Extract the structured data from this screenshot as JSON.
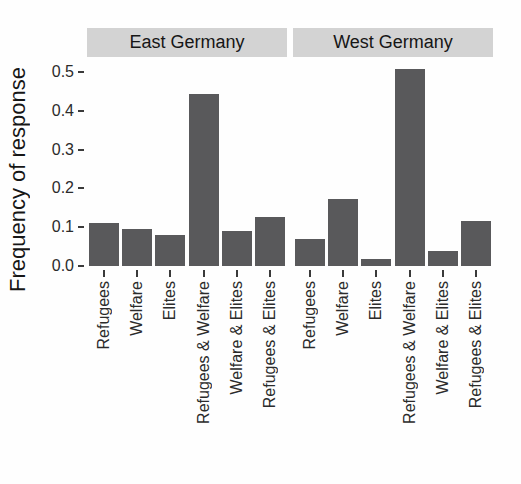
{
  "chart_data": {
    "type": "bar",
    "title": "",
    "xlabel": "",
    "ylabel": "Frequency of response",
    "categories": [
      "Refugees",
      "Welfare",
      "Elites",
      "Refugees & Welfare",
      "Welfare & Elites",
      "Refugees & Elites"
    ],
    "facets": [
      {
        "label": "East Germany",
        "values": [
          0.112,
          0.095,
          0.08,
          0.443,
          0.089,
          0.126
        ]
      },
      {
        "label": "West Germany",
        "values": [
          0.069,
          0.172,
          0.017,
          0.507,
          0.039,
          0.116
        ]
      }
    ],
    "y_ticks": [
      0.0,
      0.1,
      0.2,
      0.3,
      0.4,
      0.5
    ],
    "ylim": [
      0,
      0.52
    ],
    "grid": false,
    "legend": "none",
    "x_label_rotation_deg": 90,
    "colors": {
      "bar_fill": "#59595b",
      "strip_background": "#d3d3d3",
      "text": "#1f1f1f",
      "tick": "#3a3a3a",
      "background": "#fefefe"
    }
  }
}
